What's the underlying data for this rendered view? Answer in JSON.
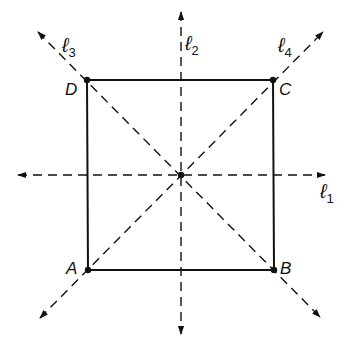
{
  "diagram": {
    "type": "square-symmetry-axes",
    "colors": {
      "stroke": "#111111",
      "background": "#ffffff"
    },
    "center": {
      "x": 181,
      "y": 175
    },
    "vertices": [
      {
        "id": "A",
        "label": "A",
        "x": 88,
        "y": 270
      },
      {
        "id": "B",
        "label": "B",
        "x": 274,
        "y": 270
      },
      {
        "id": "C",
        "label": "C",
        "x": 273,
        "y": 80
      },
      {
        "id": "D",
        "label": "D",
        "x": 87,
        "y": 80
      }
    ],
    "axes": [
      {
        "id": "l1",
        "label": "ℓ",
        "subscript": "1",
        "orientation": "horizontal"
      },
      {
        "id": "l2",
        "label": "ℓ",
        "subscript": "2",
        "orientation": "vertical"
      },
      {
        "id": "l3",
        "label": "ℓ",
        "subscript": "3",
        "orientation": "diagonal-DB"
      },
      {
        "id": "l4",
        "label": "ℓ",
        "subscript": "4",
        "orientation": "diagonal-AC"
      }
    ]
  }
}
